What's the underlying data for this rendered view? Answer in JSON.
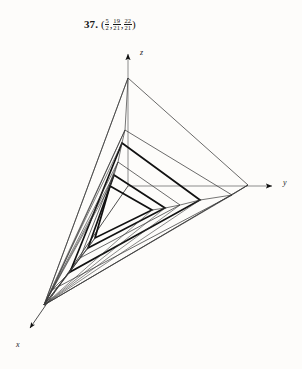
{
  "figure": {
    "problem_number": "37.",
    "point_label": {
      "open_paren": "(",
      "close_paren": ")",
      "separator": ",",
      "coordinates": [
        {
          "numerator": "5",
          "denominator": "2"
        },
        {
          "numerator": "19",
          "denominator": "21"
        },
        {
          "numerator": "22",
          "denominator": "21"
        }
      ]
    },
    "caption_plain": "37. (5/2, 19/21, 22/21)",
    "axes": [
      {
        "name": "z-axis",
        "label": "z",
        "direction": "up"
      },
      {
        "name": "y-axis",
        "label": "y",
        "direction": "right"
      },
      {
        "name": "x-axis",
        "label": "x",
        "direction": "down-left"
      }
    ],
    "colors": {
      "background": "#fdfcfa",
      "ink": "#1a1a1a",
      "axis_line": "#8c8c8c",
      "light_line": "#3a3a3a",
      "bold_line": "#111111"
    }
  },
  "chart_data": {
    "type": "line",
    "title": "37. (5/2, 19/21, 22/21)",
    "subtitle": "",
    "xlabel": "x",
    "ylabel": "y",
    "zlabel": "z",
    "projection": {
      "origin_px": [
        128,
        186
      ],
      "z_axis_tip_px": [
        128,
        48
      ],
      "y_axis_tip_px": [
        278,
        186
      ],
      "x_axis_tip_px": [
        25,
        333
      ]
    },
    "axis_ranges": {
      "x": [
        0,
        5
      ],
      "y": [
        0,
        5
      ],
      "z": [
        0,
        5
      ]
    },
    "grid": false,
    "legend": "none",
    "series": [
      {
        "name": "triangle-1-outermost",
        "emphasis": "light",
        "vertices_px": [
          [
            128,
            78
          ],
          [
            248,
            185
          ],
          [
            44,
            305
          ]
        ]
      },
      {
        "name": "triangle-2",
        "emphasis": "light",
        "vertices_px": [
          [
            125,
            130
          ],
          [
            232,
            195
          ],
          [
            52,
            290
          ]
        ]
      },
      {
        "name": "triangle-3",
        "emphasis": "bold",
        "vertices_px": [
          [
            122,
            143
          ],
          [
            200,
            200
          ],
          [
            70,
            272
          ]
        ]
      },
      {
        "name": "triangle-4",
        "emphasis": "light",
        "vertices_px": [
          [
            118,
            162
          ],
          [
            180,
            205
          ],
          [
            80,
            258
          ]
        ]
      },
      {
        "name": "triangle-5",
        "emphasis": "bold",
        "vertices_px": [
          [
            114,
            175
          ],
          [
            165,
            208
          ],
          [
            88,
            248
          ]
        ]
      },
      {
        "name": "triangle-6-innermost",
        "emphasis": "bold",
        "vertices_px": [
          [
            110,
            186
          ],
          [
            152,
            210
          ],
          [
            95,
            238
          ]
        ]
      }
    ],
    "connector_lines": {
      "name": "vertex-connectors",
      "description": "Straight edges joining corresponding vertices of successive triangles, converging toward the lower-left x-axis direction."
    }
  }
}
